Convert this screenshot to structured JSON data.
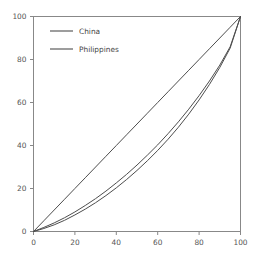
{
  "chart_data": {
    "type": "line",
    "title": "",
    "subtitle": "",
    "xlabel": "",
    "ylabel": "",
    "xlim": [
      0,
      100
    ],
    "ylim": [
      0,
      100
    ],
    "grid": false,
    "legend_position": "upper-left-inside",
    "xticks": [
      0,
      20,
      40,
      60,
      80,
      100
    ],
    "yticks": [
      0,
      20,
      40,
      60,
      80,
      100
    ],
    "xticklabels": [
      "0",
      "20",
      "40",
      "60",
      "80",
      "100"
    ],
    "yticklabels": [
      "0",
      "20",
      "40",
      "60",
      "80",
      "100"
    ],
    "x": [
      0,
      5,
      10,
      15,
      20,
      25,
      30,
      35,
      40,
      45,
      50,
      55,
      60,
      65,
      70,
      75,
      80,
      85,
      90,
      95,
      100
    ],
    "series": [
      {
        "name": "China",
        "color": "#4d4d4d",
        "values": [
          0,
          1.4,
          3.1,
          5.2,
          7.7,
          10.4,
          13.4,
          16.7,
          20.3,
          24.2,
          28.4,
          32.9,
          37.7,
          42.9,
          48.5,
          54.6,
          61.2,
          68.4,
          76.3,
          85.3,
          100
        ]
      },
      {
        "name": "Philippines",
        "color": "#4d4d4d",
        "values": [
          0,
          1.9,
          4.0,
          6.4,
          9.1,
          12.1,
          15.3,
          18.8,
          22.6,
          26.6,
          30.9,
          35.5,
          40.3,
          45.5,
          51.0,
          56.9,
          63.2,
          70.0,
          77.4,
          85.9,
          100
        ]
      },
      {
        "name": "equality-line",
        "color": "#4d4d4d",
        "values": [
          0,
          5,
          10,
          15,
          20,
          25,
          30,
          35,
          40,
          45,
          50,
          55,
          60,
          65,
          70,
          75,
          80,
          85,
          90,
          95,
          100
        ]
      }
    ]
  },
  "legend": {
    "entries": [
      {
        "label": "China"
      },
      {
        "label": "Philippines"
      }
    ]
  },
  "axes": {
    "spine_color": "#888888",
    "tick_color": "#888888",
    "label_color": "#555555"
  }
}
